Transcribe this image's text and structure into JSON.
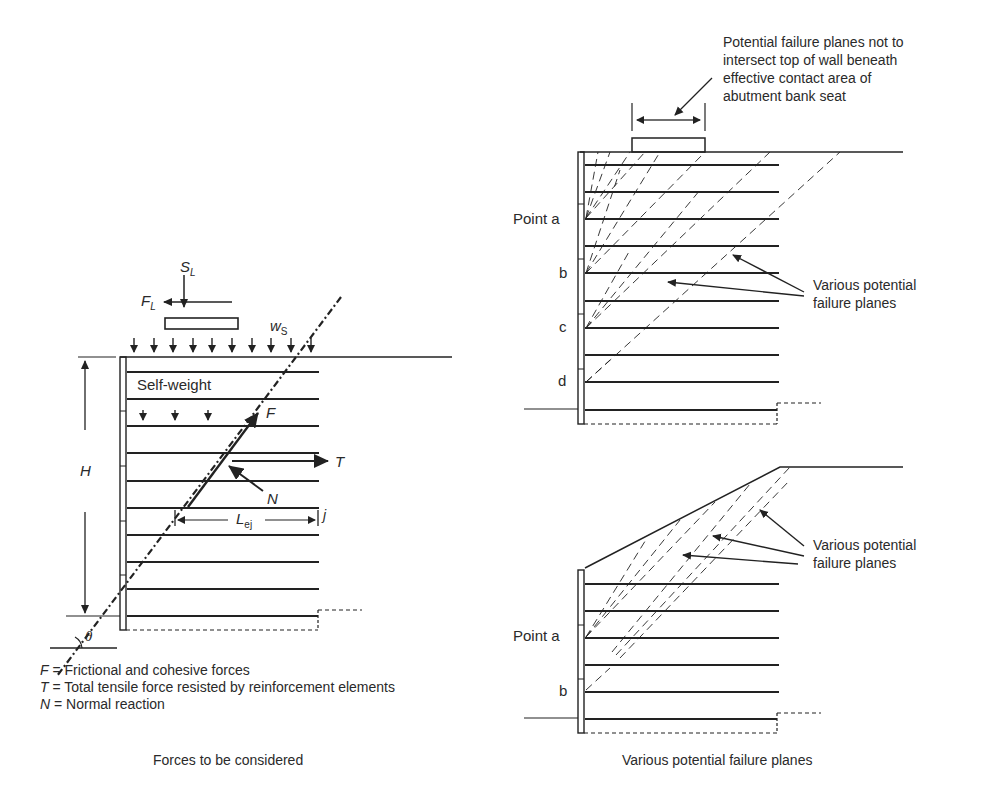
{
  "left_panel": {
    "caption": "Forces to be considered",
    "labels": {
      "SL_main": "S",
      "SL_sub": "L",
      "FL_main": "F",
      "FL_sub": "L",
      "ws_main": "w",
      "ws_sub": "S",
      "self_weight": "Self-weight",
      "F": "F",
      "T": "T",
      "N": "N",
      "H": "H",
      "Lej_main": "L",
      "Lej_sub": "ej",
      "j": "j",
      "theta": "θ"
    },
    "legend": [
      {
        "symbol": "F",
        "text": " = Frictional and cohesive forces"
      },
      {
        "symbol": "T",
        "text": " = Total tensile force resisted by reinforcement elements"
      },
      {
        "symbol": "N",
        "text": " = Normal reaction"
      }
    ]
  },
  "right_top_panel": {
    "note": [
      "Potential failure planes not to",
      "intersect top of wall beneath",
      "effective contact area of",
      "abutment bank seat"
    ],
    "points": [
      "Point a",
      "b",
      "c",
      "d"
    ],
    "callout": [
      "Various potential",
      "failure planes"
    ]
  },
  "right_bottom_panel": {
    "points": [
      "Point a",
      "b"
    ],
    "callout": [
      "Various potential",
      "failure planes"
    ],
    "caption": "Various potential failure planes"
  },
  "colors": {
    "ink": "#222222",
    "background": "#ffffff"
  }
}
